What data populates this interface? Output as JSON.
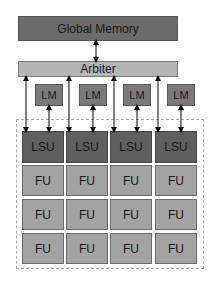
{
  "diagram": {
    "global_memory": "Global Memory",
    "arbiter": "Arbiter",
    "local_memories": [
      "LM",
      "LM",
      "LM",
      "LM"
    ],
    "lsus": [
      "LSU",
      "LSU",
      "LSU",
      "LSU"
    ],
    "fu_rows": [
      [
        "FU",
        "FU",
        "FU",
        "FU"
      ],
      [
        "FU",
        "FU",
        "FU",
        "FU"
      ],
      [
        "FU",
        "FU",
        "FU",
        "FU"
      ]
    ],
    "colors": {
      "global_memory": "#6b6b6b",
      "arbiter": "#b4b4b4",
      "local_memory": "#7a7a7a",
      "lsu": "#5f5f5f",
      "fu": "#a3a3a3"
    }
  }
}
